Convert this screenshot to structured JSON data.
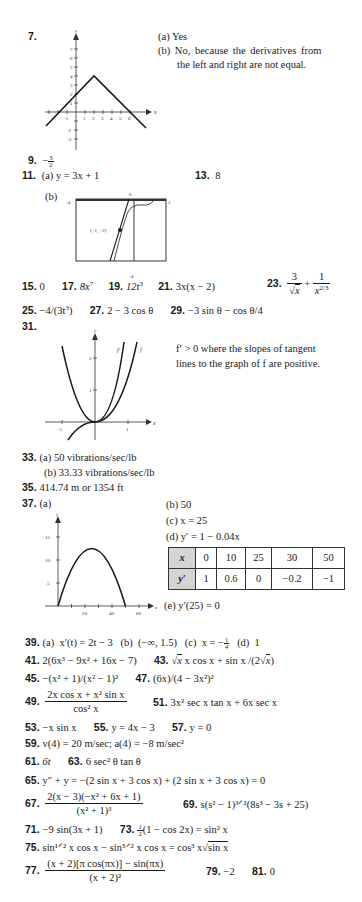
{
  "page": {
    "background": "#ffffff",
    "text_color": "#1a1a1a"
  },
  "problems": {
    "p7": {
      "num": "7.",
      "a": "(a)  Yes",
      "b_line1": "(b)  No, because the derivatives from",
      "b_line2": "the left and right are not equal.",
      "graph": {
        "x_label": "x",
        "y_label": "y",
        "x_ticks": [
          "-1",
          "1",
          "2",
          "3",
          "4",
          "5",
          "6"
        ],
        "y_ticks": [
          "7",
          "6",
          "5",
          "4",
          "3",
          "2",
          "1",
          "-1",
          "-2",
          "-3"
        ]
      }
    },
    "p9": {
      "num": "9.",
      "sign": "−",
      "numer": "3",
      "denom": "2"
    },
    "p11": {
      "num": "11.",
      "a": "(a)  y = 3x + 1",
      "b": "(b)",
      "graph": {
        "left": "-4",
        "right": "2",
        "top": "0",
        "bottom": "-4",
        "point_label": "(−1, −2)"
      }
    },
    "p13": {
      "num": "13.",
      "answer": "8"
    },
    "p15": {
      "num": "15.",
      "answer": "0"
    },
    "p17": {
      "num": "17.",
      "base": "8x",
      "exp": "7"
    },
    "p19": {
      "num": "19.",
      "base": "12t",
      "exp": "3"
    },
    "p21": {
      "num": "21.",
      "answer": "3x(x − 2)"
    },
    "p23": {
      "num": "23.",
      "n1": "3",
      "d1": "x",
      "plus": "+",
      "n2": "1",
      "d2_base": "x",
      "d2_exp": "2/3"
    },
    "p25": {
      "num": "25.",
      "pre": "−4/(3t",
      "exp": "3",
      "post": ")"
    },
    "p27": {
      "num": "27.",
      "answer": "2 − 3 cos θ"
    },
    "p29": {
      "num": "29.",
      "answer": "−3 sin θ − cos θ/4"
    },
    "p31": {
      "num": "31.",
      "line1": "f′ > 0 where the slopes of tangent",
      "line2": "lines to the graph of f are positive.",
      "graph": {
        "x_label": "x",
        "y_label": "y",
        "x_ticks": [
          "-1",
          "1"
        ],
        "y_ticks": [
          "1",
          "2"
        ],
        "curve_labels": [
          "f′",
          "f"
        ]
      }
    },
    "p33": {
      "num": "33.",
      "a": "(a)  50 vibrations/sec/lb",
      "b": "(b)  33.33 vibrations/sec/lb"
    },
    "p35": {
      "num": "35.",
      "answer": "414.74 m or 1354 ft"
    },
    "p37": {
      "num": "37.",
      "a": "(a)",
      "b": "(b)  50",
      "c": "(c)  x = 25",
      "d": "(d)  y′ = 1 − 0.04x",
      "e": "(e)  y′(25) = 0",
      "table": {
        "row_headers": [
          "x",
          "y′"
        ],
        "x_values": [
          "0",
          "10",
          "25",
          "30",
          "50"
        ],
        "y_values": [
          "1",
          "0.6",
          "0",
          "−0.2",
          "−1"
        ]
      },
      "graph": {
        "x_label": "x",
        "y_label": "y",
        "x_ticks": [
          "20",
          "40",
          "60"
        ],
        "y_ticks": [
          "5",
          "10",
          "15"
        ]
      }
    },
    "p39": {
      "num": "39.",
      "answer": "(a)  x′(t) = 2t − 3   (b)  (−∞, 1.5)   (c)  x = −",
      "c_frac_n": "1",
      "c_frac_d": "4",
      "d": "(d)  1"
    },
    "p41": {
      "num": "41.",
      "answer": "2(6x³ − 9x² + 16x − 7)"
    },
    "p43": {
      "num": "43.",
      "answer_pre": "x cos x + sin x /(2",
      "answer_post": "x)"
    },
    "p45": {
      "num": "45.",
      "answer": "−(x² + 1)/(x² − 1)²"
    },
    "p47": {
      "num": "47.",
      "answer": "(6x)/(4 − 3x²)²"
    },
    "p49": {
      "num": "49.",
      "numer": "2x cos x + x² sin x",
      "denom": "cos² x"
    },
    "p51": {
      "num": "51.",
      "answer": "3x² sec x tan x + 6x sec x"
    },
    "p53": {
      "num": "53.",
      "answer": "−x sin x"
    },
    "p55": {
      "num": "55.",
      "answer": "y = 4x − 3"
    },
    "p57": {
      "num": "57.",
      "answer": "y = 0"
    },
    "p59": {
      "num": "59.",
      "answer": "v(4) = 20 m/sec; a(4) = −8 m/sec²"
    },
    "p61": {
      "num": "61.",
      "answer": "6t"
    },
    "p63": {
      "num": "63.",
      "answer": "6 sec² θ tan θ"
    },
    "p65": {
      "num": "65.",
      "answer": "y″ + y = −(2 sin x + 3 cos x) + (2 sin x + 3 cos x) = 0"
    },
    "p67": {
      "num": "67.",
      "numer": "2(x − 3)(−x² + 6x + 1)",
      "denom": "(x² + 1)³"
    },
    "p69": {
      "num": "69.",
      "answer": "s(s² − 1)³ᐟ²(8s³ − 3s + 25)"
    },
    "p71": {
      "num": "71.",
      "answer": "−9 sin(3x + 1)"
    },
    "p73": {
      "num": "73.",
      "frac_n": "1",
      "frac_d": "2",
      "answer": "(1 − cos 2x) = sin² x"
    },
    "p75": {
      "num": "75.",
      "answer_pre": "sin¹ᐟ² x cos x − sin⁵ᐟ² x cos x = cos³ x",
      "sqrt_arg": "sin x"
    },
    "p77": {
      "num": "77.",
      "numer": "(x + 2)[π cos(πx)] − sin(πx)",
      "denom": "(x + 2)²"
    },
    "p79": {
      "num": "79.",
      "answer": "−2"
    },
    "p81": {
      "num": "81.",
      "answer": "0"
    }
  }
}
